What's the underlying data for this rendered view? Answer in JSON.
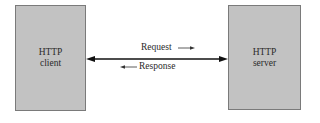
{
  "diagram": {
    "type": "client-server",
    "nodes": [
      {
        "id": "client",
        "lines": [
          "HTTP",
          "client"
        ]
      },
      {
        "id": "server",
        "lines": [
          "HTTP",
          "server"
        ]
      }
    ],
    "connection": {
      "style": "bidirectional-arrow",
      "from": "client",
      "to": "server"
    },
    "messages": [
      {
        "label": "Request",
        "direction": "client-to-server",
        "arrow": "right"
      },
      {
        "label": "Response",
        "direction": "server-to-client",
        "arrow": "left"
      }
    ],
    "colors": {
      "box_fill": "#c2c2c2",
      "box_border": "#7a7a7a",
      "line": "#111111",
      "text": "#2a2a2a"
    }
  }
}
